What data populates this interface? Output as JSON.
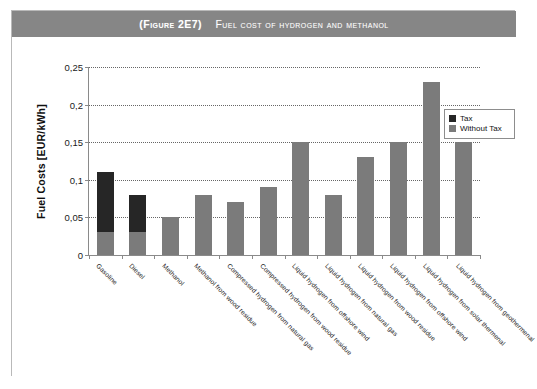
{
  "figure": {
    "number_label": "(Figure 2E7)",
    "title": "Fuel cost of hydrogen and methanol",
    "band_color": "#868686",
    "frame_color": "#b9b9b9"
  },
  "legend": {
    "position": "right",
    "items": [
      {
        "label": "Tax",
        "color": "#262626",
        "swatch_name": "legend-swatch-tax"
      },
      {
        "label": "Without Tax",
        "color": "#7b7b7b",
        "swatch_name": "legend-swatch-without-tax"
      }
    ]
  },
  "chart_data": {
    "type": "bar",
    "title": "Fuel cost of hydrogen and methanol",
    "subtitle": "(Figure 2E7)",
    "xlabel": "",
    "ylabel": "Fuel Costs [EUR/kWh]",
    "ylim": [
      0,
      0.25
    ],
    "ytick_labels": [
      "0",
      "0,05",
      "0,1",
      "0,15",
      "0,2",
      "0,25"
    ],
    "ytick_values": [
      0,
      0.05,
      0.1,
      0.15,
      0.2,
      0.25
    ],
    "grid": true,
    "grid_style": "dotted-horizontal",
    "stacked": true,
    "legend_position": "right",
    "categories": [
      "Gasoline",
      "Diesel",
      "Methanol",
      "Methanol from wood residue",
      "Compressed hydrogen from natural gas",
      "Compressed hydrogen from wood residue",
      "Liquid hydrogen from offshore wind",
      "Liquid hydrogen from natural gas",
      "Liquid hydrogen from wood residue",
      "Liquid hydrogen from offshore wind",
      "Liquid hydrogen from solar thermenal",
      "Liquid hydrogen from geothermenal"
    ],
    "series": [
      {
        "name": "Without Tax",
        "color": "#7b7b7b",
        "values": [
          0.03,
          0.03,
          0.05,
          0.08,
          0.07,
          0.09,
          0.15,
          0.08,
          0.13,
          0.15,
          0.23,
          0.15
        ]
      },
      {
        "name": "Tax",
        "color": "#262626",
        "values": [
          0.08,
          0.05,
          0,
          0,
          0,
          0,
          0,
          0,
          0,
          0,
          0,
          0
        ]
      }
    ],
    "totals": [
      0.11,
      0.08,
      0.05,
      0.08,
      0.07,
      0.09,
      0.15,
      0.08,
      0.13,
      0.15,
      0.23,
      0.15
    ]
  }
}
